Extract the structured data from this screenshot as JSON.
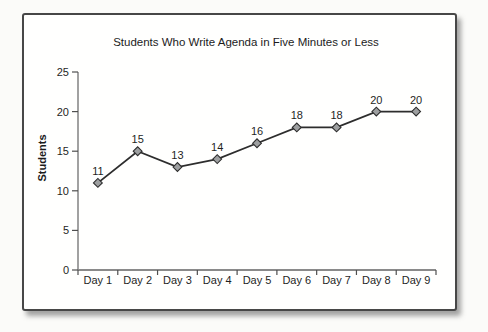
{
  "page": {
    "background_color": "#fbfbf9"
  },
  "card": {
    "background_color": "#ffffff",
    "border_color": "#474747"
  },
  "chart_data": {
    "type": "line",
    "title": "Students Who Write Agenda in Five Minutes or Less",
    "xlabel": "",
    "ylabel": "Students",
    "categories": [
      "Day 1",
      "Day 2",
      "Day 3",
      "Day 4",
      "Day 5",
      "Day 6",
      "Day 7",
      "Day 8",
      "Day 9"
    ],
    "values": [
      11,
      15,
      13,
      14,
      16,
      18,
      18,
      20,
      20
    ],
    "data_labels_shown": true,
    "ylim": [
      0,
      25
    ],
    "yticks": [
      0,
      5,
      10,
      15,
      20,
      25
    ],
    "grid": false,
    "legend": "none",
    "marker_shape": "diamond",
    "colors": {
      "line": "#2d2d2d",
      "marker_fill": "#9d9fa0",
      "marker_stroke": "#2d2d2d",
      "axis_line": "#8a8a8a",
      "tick": "#4f4f4f",
      "text": "#1f1f1f"
    }
  }
}
